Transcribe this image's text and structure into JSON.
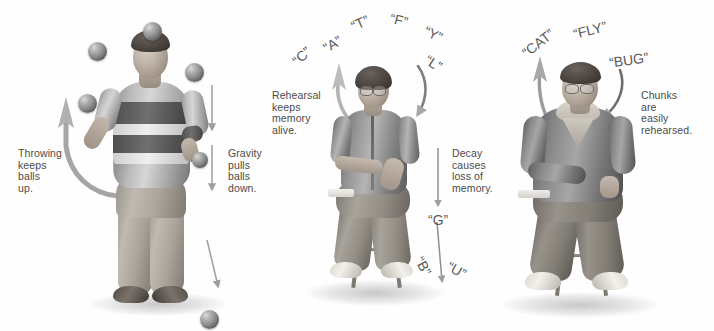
{
  "figure_title": "Juggling analogy for rehearsal and decay in short-term memory",
  "panels": [
    {
      "id": "juggling",
      "name": "Juggling balls",
      "captions": [
        {
          "name": "throwing-caption",
          "text": "Throwing\nkeeps\nballs\nup."
        },
        {
          "name": "gravity-caption",
          "text": "Gravity\npulls\nballs\ndown."
        }
      ],
      "person": {
        "name": "juggler",
        "description": "Man in striped rugby shirt juggling balls"
      },
      "balls": [
        {
          "name": "ball-top",
          "x": 143,
          "y": 22,
          "size": 19
        },
        {
          "name": "ball-upper-left",
          "x": 88,
          "y": 42,
          "size": 19
        },
        {
          "name": "ball-upper-right",
          "x": 185,
          "y": 63,
          "size": 19
        },
        {
          "name": "ball-left-hand",
          "x": 78,
          "y": 94,
          "size": 19
        },
        {
          "name": "ball-right-hand",
          "x": 192,
          "y": 152,
          "size": 16
        },
        {
          "name": "ball-falling",
          "x": 200,
          "y": 310,
          "size": 19
        }
      ],
      "arrows": [
        {
          "name": "throwing-arrow",
          "direction": "up-curved"
        },
        {
          "name": "gravity-arrow-upper",
          "direction": "down"
        },
        {
          "name": "gravity-arrow-lower",
          "direction": "down"
        },
        {
          "name": "gravity-arrow-bottom",
          "direction": "down-slanted"
        }
      ]
    },
    {
      "id": "decay",
      "name": "Letter rehearsal and decay",
      "captions": [
        {
          "name": "rehearsal-caption",
          "text": "Rehearsal\nkeeps\nmemory\nalive."
        },
        {
          "name": "decay-caption",
          "text": "Decay\ncauses\nloss of\nmemory."
        }
      ],
      "person": {
        "name": "seated-woman",
        "description": "Woman with glasses seated on a stool"
      },
      "letters_up": [
        {
          "name": "letter-C",
          "text": "“C”",
          "x": 292,
          "y": 48,
          "rot": -42,
          "size": 14
        },
        {
          "name": "letter-A",
          "text": "“A”",
          "x": 323,
          "y": 36,
          "rot": -30,
          "size": 14
        },
        {
          "name": "letter-T",
          "text": "“T”",
          "x": 351,
          "y": 15,
          "rot": -24,
          "size": 14
        },
        {
          "name": "letter-F",
          "text": "“F”",
          "x": 390,
          "y": 12,
          "rot": 14,
          "size": 14
        },
        {
          "name": "letter-Y",
          "text": "“Y”",
          "x": 424,
          "y": 26,
          "rot": 26,
          "size": 14
        },
        {
          "name": "letter-L",
          "text": "“L”",
          "x": 425,
          "y": 55,
          "rot": 32,
          "size": 14
        }
      ],
      "letters_down": [
        {
          "name": "letter-G",
          "text": "“G”",
          "x": 428,
          "y": 212,
          "rot": 0,
          "size": 14
        },
        {
          "name": "letter-B",
          "text": "“B”",
          "x": 414,
          "y": 258,
          "rot": 62,
          "size": 14
        },
        {
          "name": "letter-U",
          "text": "“U”",
          "x": 447,
          "y": 262,
          "rot": 30,
          "size": 14
        }
      ],
      "arrows": [
        {
          "name": "rehearsal-arrow-up",
          "direction": "up-curved"
        },
        {
          "name": "rehearsal-arrow-down",
          "direction": "down-curved"
        },
        {
          "name": "decay-arrow-upper",
          "direction": "down"
        },
        {
          "name": "decay-arrow-lower",
          "direction": "down-slanted"
        }
      ]
    },
    {
      "id": "chunking",
      "name": "Chunking words",
      "captions": [
        {
          "name": "chunks-caption",
          "text": "Chunks\nare\neasily\nrehearsed."
        }
      ],
      "person": {
        "name": "seated-man",
        "description": "Heavyset man with glasses seated on a stool"
      },
      "words": [
        {
          "name": "word-CAT",
          "text": "“CAT”",
          "x": 520,
          "y": 35,
          "rot": -38,
          "size": 14
        },
        {
          "name": "word-FLY",
          "text": "“FLY”",
          "x": 573,
          "y": 22,
          "rot": -14,
          "size": 14
        },
        {
          "name": "word-BUG",
          "text": "“BUG”",
          "x": 609,
          "y": 52,
          "rot": -8,
          "size": 14
        }
      ],
      "arrows": [
        {
          "name": "chunk-arrow-up",
          "direction": "up-curved"
        },
        {
          "name": "chunk-arrow-down",
          "direction": "down-curved"
        }
      ]
    }
  ],
  "colors": {
    "background": "#fefefe",
    "text": "#4a4a4a",
    "letter_text": "#5a5a5a",
    "arrow": "#9a9a9a"
  }
}
